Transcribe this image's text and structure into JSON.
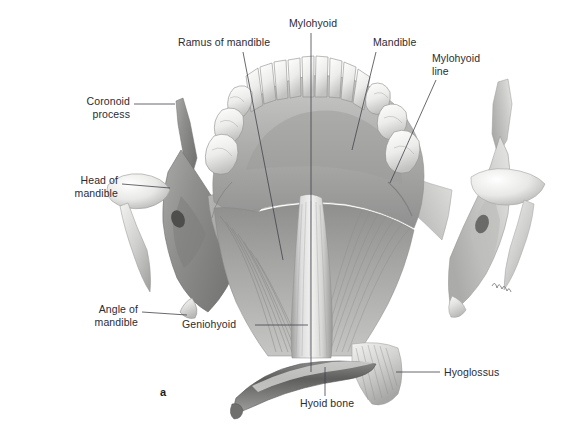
{
  "figure": {
    "panel_letter": "a",
    "background_color": "#ffffff",
    "label_color": "#2b2b33",
    "leader_color": "#43434c"
  },
  "labels": [
    {
      "id": "coronoid-process",
      "text": "Coronoid\nprocess",
      "align": "right",
      "x": 46,
      "y": 95,
      "width": 84,
      "leader": [
        [
          134,
          104
        ],
        [
          175,
          104
        ]
      ]
    },
    {
      "id": "head-of-mandible",
      "text": "Head of\nmandible",
      "align": "right",
      "x": 32,
      "y": 174,
      "width": 86,
      "leader": [
        [
          122,
          184
        ],
        [
          170,
          188
        ]
      ]
    },
    {
      "id": "angle-of-mandible",
      "text": "Angle of\nmandible",
      "align": "right",
      "x": 56,
      "y": 303,
      "width": 82,
      "leader": [
        [
          142,
          312
        ],
        [
          187,
          315
        ]
      ]
    },
    {
      "id": "ramus-of-mandible",
      "text": "Ramus of mandible",
      "align": "left",
      "x": 178,
      "y": 36,
      "width": 108,
      "leader": [
        [
          243,
          52
        ],
        [
          283,
          260
        ]
      ]
    },
    {
      "id": "mylohyoid",
      "text": "Mylohyoid",
      "align": "left",
      "x": 289,
      "y": 17,
      "width": 70,
      "leader": [
        [
          311,
          33
        ],
        [
          311,
          372
        ]
      ]
    },
    {
      "id": "mandible",
      "text": "Mandible",
      "align": "left",
      "x": 373,
      "y": 36,
      "width": 58,
      "leader": [
        [
          376,
          52
        ],
        [
          352,
          150
        ]
      ]
    },
    {
      "id": "mylohyoid-line",
      "text": "Mylohyoid\nline",
      "align": "left",
      "x": 432,
      "y": 52,
      "width": 62,
      "leader": [
        [
          436,
          80
        ],
        [
          390,
          183
        ]
      ]
    },
    {
      "id": "geniohyoid",
      "text": "Geniohyoid",
      "align": "left",
      "x": 182,
      "y": 318,
      "width": 68,
      "leader": [
        [
          255,
          325
        ],
        [
          308,
          325
        ]
      ]
    },
    {
      "id": "hyoid-bone",
      "text": "Hyoid bone",
      "align": "left",
      "x": 300,
      "y": 397,
      "width": 70,
      "leader": [
        [
          325,
          396
        ],
        [
          325,
          367
        ]
      ]
    },
    {
      "id": "hyoglossus",
      "text": "Hyoglossus",
      "align": "left",
      "x": 444,
      "y": 366,
      "width": 70,
      "leader": [
        [
          440,
          372
        ],
        [
          396,
          372
        ]
      ]
    }
  ],
  "anatomy_parts": [
    "coronoid process",
    "head of mandible",
    "angle of mandible",
    "ramus of mandible",
    "mandible",
    "mylohyoid line",
    "mylohyoid muscle",
    "geniohyoid muscle",
    "hyoglossus muscle",
    "hyoid bone",
    "teeth"
  ]
}
